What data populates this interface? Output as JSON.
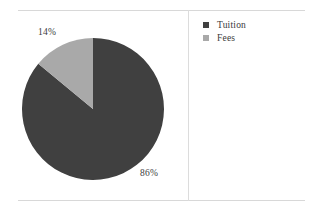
{
  "chart_data": {
    "type": "pie",
    "title": "",
    "categories": [
      "Tuition",
      "Fees"
    ],
    "values": [
      86,
      14
    ],
    "value_labels": [
      "86%",
      "14%"
    ],
    "colors": [
      "#404040",
      "#a9a9a9"
    ],
    "legend_position": "right",
    "grid": false,
    "start_angle_deg": 90,
    "direction": "clockwise",
    "units": "percent",
    "slices": [
      {
        "name": "Tuition",
        "value": 86,
        "label": "86%",
        "color": "#404040"
      },
      {
        "name": "Fees",
        "value": 14,
        "label": "14%",
        "color": "#a9a9a9"
      }
    ]
  },
  "figure": {
    "frame_color": "#d8d8d8",
    "divider_color": "#dcdcdc",
    "background": "#ffffff"
  },
  "labels": {
    "fees_pct": "14%",
    "tuition_pct": "86%"
  },
  "legend": {
    "items": [
      {
        "label": "Tuition",
        "color": "#404040",
        "marker": "square-marker"
      },
      {
        "label": "Fees",
        "color": "#a9a9a9",
        "marker": "square-marker"
      }
    ]
  }
}
